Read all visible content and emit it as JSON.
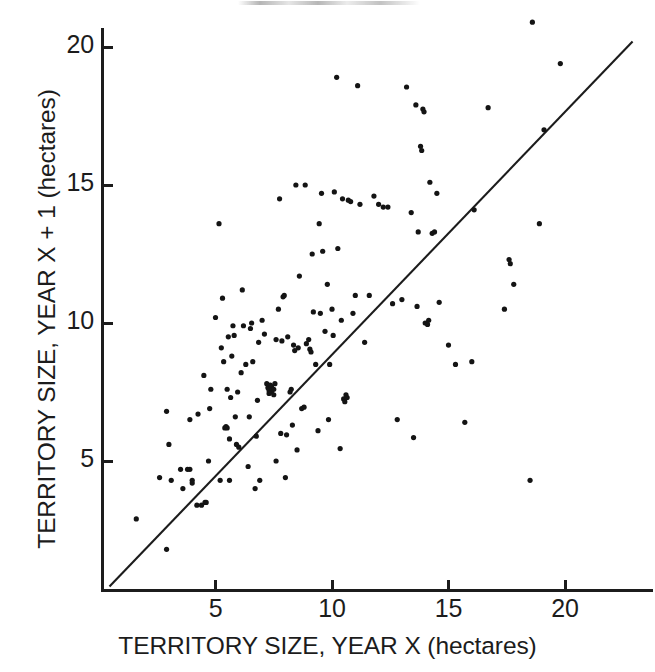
{
  "figure": {
    "background": "#ffffff",
    "ink_color": "#141414"
  },
  "chart_data": {
    "type": "scatter",
    "title": "",
    "subtitle": "",
    "xlabel": "TERRITORY SIZE, YEAR X (hectares)",
    "ylabel": "TERRITORY SIZE, YEAR X + 1 (hectares)",
    "xlim": [
      0,
      23.7
    ],
    "ylim": [
      0,
      21.4
    ],
    "xticks": [
      5,
      10,
      15,
      20
    ],
    "yticks": [
      5,
      10,
      15,
      20
    ],
    "xtick_labels": [
      "5",
      "10",
      "15",
      "20"
    ],
    "ytick_labels": [
      "5",
      "10",
      "15",
      "20"
    ],
    "grid": false,
    "legend": null,
    "legend_position": "none",
    "annotations": [],
    "marker": {
      "shape": "circle",
      "color": "#141414",
      "size_px": 5.2
    },
    "reference_line": {
      "name": "y = x identity line",
      "type": "line",
      "slope": 1,
      "intercept": 0,
      "x_start": 0.45,
      "y_start": 0.45,
      "x_end": 22.9,
      "y_end": 20.2,
      "color": "#1c1c1c",
      "width_px": 2.1
    },
    "series": [
      {
        "name": "Territory size pairs",
        "n_points": 196,
        "points": [
          [
            1.6,
            2.9
          ],
          [
            2.9,
            1.8
          ],
          [
            2.6,
            4.4
          ],
          [
            3.1,
            4.3
          ],
          [
            3.0,
            5.6
          ],
          [
            2.9,
            6.8
          ],
          [
            3.5,
            4.7
          ],
          [
            3.6,
            4.0
          ],
          [
            3.8,
            4.7
          ],
          [
            3.9,
            4.7
          ],
          [
            3.9,
            6.5
          ],
          [
            4.0,
            4.3
          ],
          [
            4.0,
            4.2
          ],
          [
            4.2,
            3.4
          ],
          [
            4.25,
            6.7
          ],
          [
            4.4,
            3.4
          ],
          [
            4.5,
            8.1
          ],
          [
            4.55,
            3.5
          ],
          [
            4.6,
            3.5
          ],
          [
            4.7,
            5.0
          ],
          [
            4.75,
            6.9
          ],
          [
            4.8,
            7.6
          ],
          [
            5.0,
            10.2
          ],
          [
            5.15,
            13.6
          ],
          [
            5.2,
            4.3
          ],
          [
            5.25,
            9.1
          ],
          [
            5.3,
            10.9
          ],
          [
            5.35,
            8.6
          ],
          [
            5.4,
            6.2
          ],
          [
            5.45,
            6.25
          ],
          [
            5.5,
            6.2
          ],
          [
            5.5,
            7.6
          ],
          [
            5.55,
            9.5
          ],
          [
            5.6,
            4.3
          ],
          [
            5.6,
            5.8
          ],
          [
            5.65,
            7.3
          ],
          [
            5.7,
            8.8
          ],
          [
            5.75,
            9.9
          ],
          [
            5.8,
            9.55
          ],
          [
            5.85,
            6.6
          ],
          [
            5.9,
            5.6
          ],
          [
            5.95,
            7.5
          ],
          [
            6.0,
            5.5
          ],
          [
            6.1,
            8.2
          ],
          [
            6.15,
            11.2
          ],
          [
            6.2,
            9.9
          ],
          [
            6.3,
            8.5
          ],
          [
            6.4,
            4.8
          ],
          [
            6.45,
            6.6
          ],
          [
            6.5,
            9.8
          ],
          [
            6.55,
            10.0
          ],
          [
            6.6,
            8.6
          ],
          [
            6.7,
            4.0
          ],
          [
            6.75,
            5.9
          ],
          [
            6.8,
            7.2
          ],
          [
            6.85,
            9.3
          ],
          [
            6.9,
            4.3
          ],
          [
            7.0,
            10.1
          ],
          [
            7.1,
            9.6
          ],
          [
            7.2,
            7.8
          ],
          [
            7.25,
            7.65
          ],
          [
            7.3,
            7.55
          ],
          [
            7.3,
            7.45
          ],
          [
            7.35,
            7.75
          ],
          [
            7.4,
            7.7
          ],
          [
            7.4,
            7.5
          ],
          [
            7.45,
            7.6
          ],
          [
            7.5,
            7.6
          ],
          [
            7.5,
            7.4
          ],
          [
            7.55,
            7.8
          ],
          [
            7.6,
            5.0
          ],
          [
            7.6,
            9.4
          ],
          [
            7.7,
            10.5
          ],
          [
            7.75,
            14.5
          ],
          [
            7.8,
            6.0
          ],
          [
            7.85,
            9.35
          ],
          [
            7.9,
            10.95
          ],
          [
            7.95,
            11.0
          ],
          [
            8.0,
            4.4
          ],
          [
            8.05,
            5.95
          ],
          [
            8.1,
            9.5
          ],
          [
            8.2,
            7.5
          ],
          [
            8.25,
            7.6
          ],
          [
            8.3,
            6.3
          ],
          [
            8.35,
            9.2
          ],
          [
            8.4,
            9.0
          ],
          [
            8.45,
            15.0
          ],
          [
            8.5,
            5.4
          ],
          [
            8.55,
            9.1
          ],
          [
            8.6,
            11.7
          ],
          [
            8.7,
            6.9
          ],
          [
            8.8,
            6.95
          ],
          [
            8.85,
            15.0
          ],
          [
            8.9,
            9.25
          ],
          [
            9.0,
            9.4
          ],
          [
            9.05,
            9.05
          ],
          [
            9.1,
            8.95
          ],
          [
            9.15,
            12.5
          ],
          [
            9.2,
            10.4
          ],
          [
            9.3,
            8.5
          ],
          [
            9.4,
            6.1
          ],
          [
            9.45,
            13.6
          ],
          [
            9.5,
            10.35
          ],
          [
            9.55,
            14.7
          ],
          [
            9.6,
            12.6
          ],
          [
            9.7,
            9.7
          ],
          [
            9.8,
            11.4
          ],
          [
            9.85,
            6.5
          ],
          [
            9.9,
            8.5
          ],
          [
            10.0,
            10.5
          ],
          [
            10.05,
            9.55
          ],
          [
            10.1,
            14.75
          ],
          [
            10.2,
            18.9
          ],
          [
            10.25,
            12.7
          ],
          [
            10.35,
            5.45
          ],
          [
            10.4,
            10.1
          ],
          [
            10.45,
            14.5
          ],
          [
            10.5,
            7.25
          ],
          [
            10.55,
            7.15
          ],
          [
            10.6,
            7.4
          ],
          [
            10.65,
            7.3
          ],
          [
            10.7,
            14.45
          ],
          [
            10.8,
            14.4
          ],
          [
            10.9,
            10.35
          ],
          [
            11.0,
            11.0
          ],
          [
            11.1,
            18.6
          ],
          [
            11.2,
            14.3
          ],
          [
            11.4,
            9.3
          ],
          [
            11.6,
            11.0
          ],
          [
            11.8,
            14.6
          ],
          [
            12.0,
            14.3
          ],
          [
            12.2,
            14.2
          ],
          [
            12.4,
            14.2
          ],
          [
            12.6,
            10.7
          ],
          [
            12.8,
            6.5
          ],
          [
            13.0,
            10.85
          ],
          [
            13.2,
            18.55
          ],
          [
            13.4,
            14.0
          ],
          [
            13.5,
            5.85
          ],
          [
            13.6,
            17.9
          ],
          [
            13.65,
            10.6
          ],
          [
            13.7,
            13.3
          ],
          [
            13.8,
            16.4
          ],
          [
            13.85,
            16.25
          ],
          [
            13.9,
            17.75
          ],
          [
            13.95,
            17.65
          ],
          [
            14.0,
            10.0
          ],
          [
            14.1,
            9.95
          ],
          [
            14.15,
            10.1
          ],
          [
            14.2,
            15.1
          ],
          [
            14.3,
            13.25
          ],
          [
            14.4,
            13.3
          ],
          [
            14.5,
            14.7
          ],
          [
            14.6,
            10.75
          ],
          [
            15.0,
            9.2
          ],
          [
            15.3,
            8.5
          ],
          [
            15.7,
            6.4
          ],
          [
            16.0,
            8.6
          ],
          [
            16.1,
            14.1
          ],
          [
            16.7,
            17.8
          ],
          [
            17.4,
            10.5
          ],
          [
            17.6,
            12.3
          ],
          [
            17.65,
            12.15
          ],
          [
            17.8,
            11.4
          ],
          [
            18.5,
            4.3
          ],
          [
            18.6,
            20.9
          ],
          [
            18.9,
            13.6
          ],
          [
            19.1,
            17.0
          ],
          [
            19.8,
            19.4
          ]
        ]
      }
    ]
  }
}
